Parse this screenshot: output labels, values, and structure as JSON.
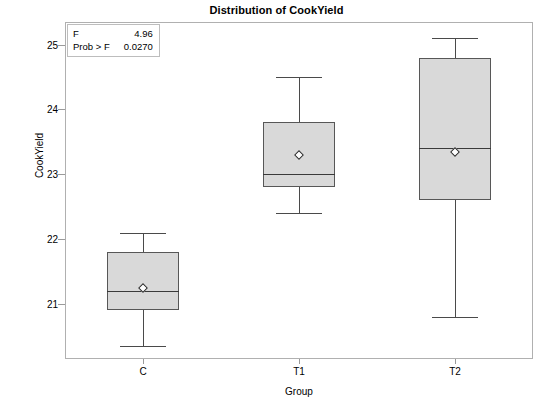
{
  "chart_data": {
    "type": "box",
    "title": "Distribution of CookYield",
    "xlabel": "Group",
    "ylabel": "CookYield",
    "categories": [
      "C",
      "T1",
      "T2"
    ],
    "ylim": [
      20.15,
      25.35
    ],
    "yticks": [
      21,
      22,
      23,
      24,
      25
    ],
    "ytick_labels": [
      "21",
      "22",
      "23",
      "24",
      "25"
    ],
    "grid": false,
    "legend": "none",
    "boxes": [
      {
        "category": "C",
        "whisker_low": 20.35,
        "q1": 20.9,
        "median": 21.2,
        "q3": 21.8,
        "whisker_high": 22.1,
        "mean": 21.25
      },
      {
        "category": "T1",
        "whisker_low": 22.4,
        "q1": 22.8,
        "median": 23.0,
        "q3": 23.8,
        "whisker_high": 24.5,
        "mean": 23.3
      },
      {
        "category": "T2",
        "whisker_low": 20.8,
        "q1": 22.6,
        "median": 23.4,
        "q3": 24.8,
        "whisker_high": 25.1,
        "mean": 23.35
      }
    ],
    "annotations": {
      "f_label": "F",
      "f_value": "4.96",
      "prob_label": "Prob > F",
      "prob_value": "0.0270"
    }
  },
  "colors": {
    "box_fill": "#d9d9d9",
    "box_border": "#575757",
    "frame": "#b0b0b0",
    "text": "#000000"
  }
}
